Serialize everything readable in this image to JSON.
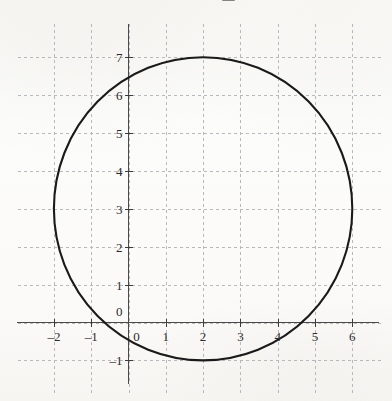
{
  "figure": {
    "kind": "scanned-graph",
    "background_color": "#fbfbf9",
    "curve_color": "#1a1a1a",
    "axis_color": "#4a4a4a",
    "grid_color": "#b9b9bd",
    "label_color": "#2b2b2b"
  },
  "axes": {
    "x_tick_labels": [
      "-2",
      "-1",
      "0",
      "1",
      "2",
      "3",
      "4",
      "5",
      "6"
    ],
    "y_tick_labels": [
      "-1",
      "0",
      "1",
      "2",
      "3",
      "4",
      "5",
      "6",
      "7"
    ],
    "x_origin_label": "0",
    "y_origin_label": "0"
  },
  "chart_data": {
    "type": "line",
    "title": "",
    "xlabel": "",
    "ylabel": "",
    "xlim": [
      -2.8,
      6.9
    ],
    "ylim": [
      -1.9,
      7.9
    ],
    "x_ticks": [
      -2,
      -1,
      0,
      1,
      2,
      3,
      4,
      5,
      6
    ],
    "y_ticks": [
      -1,
      0,
      1,
      2,
      3,
      4,
      5,
      6,
      7
    ],
    "x_tick_labels": [
      "-2",
      "-1",
      "0",
      "1",
      "2",
      "3",
      "4",
      "5",
      "6"
    ],
    "y_tick_labels": [
      "-1",
      "0",
      "1",
      "2",
      "3",
      "4",
      "5",
      "6",
      "7"
    ],
    "grid": true,
    "grid_style": "dashed",
    "legend": false,
    "series": [
      {
        "name": "circle",
        "shape": "circle",
        "equation": "(x - 2)^2 + (y - 3)^2 = 16",
        "center": [
          2,
          3
        ],
        "radius": 4,
        "extremes": {
          "top": [
            2,
            7
          ],
          "bottom": [
            2,
            -1
          ],
          "left": [
            -2,
            3
          ],
          "right": [
            6,
            3
          ]
        }
      }
    ]
  }
}
